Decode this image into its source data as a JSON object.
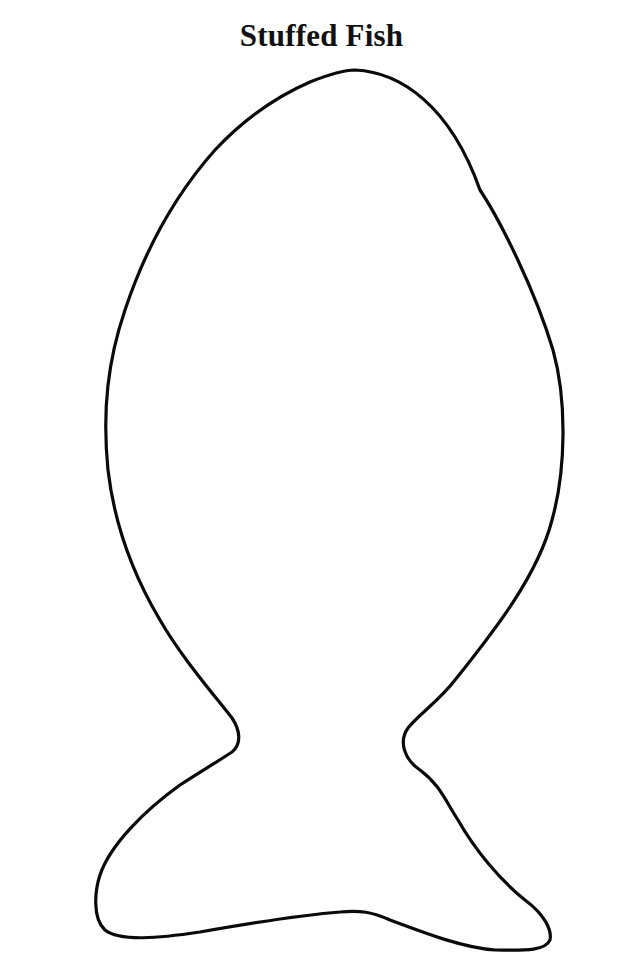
{
  "page": {
    "title": "Stuffed Fish"
  },
  "outline": {
    "shape": "fish-template",
    "stroke_color": "#0a0a0a",
    "stroke_width": 3.2,
    "fill_color": "#ffffff"
  }
}
